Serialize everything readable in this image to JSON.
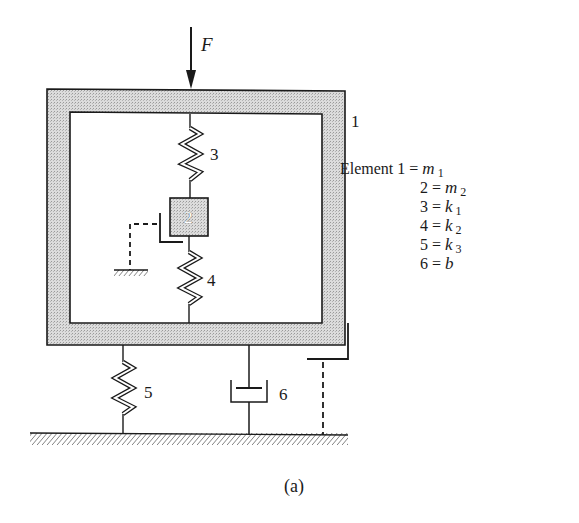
{
  "diagram": {
    "type": "mechanical-schematic",
    "caption": "(a)",
    "force_label": "F",
    "frame_label": "1",
    "mass_label": "2",
    "spring_labels": [
      "3",
      "4",
      "5"
    ],
    "damper_label": "6",
    "legend": {
      "prefix": "Element",
      "rows": [
        {
          "key": "1",
          "equals": "=",
          "var": "m",
          "sub": "1"
        },
        {
          "key": "2",
          "equals": "=",
          "var": "m",
          "sub": "2"
        },
        {
          "key": "3",
          "equals": "=",
          "var": "k",
          "sub": "1"
        },
        {
          "key": "4",
          "equals": "=",
          "var": "k",
          "sub": "2"
        },
        {
          "key": "5",
          "equals": "=",
          "var": "k",
          "sub": "3"
        },
        {
          "key": "6",
          "equals": "=",
          "var": "b",
          "sub": ""
        }
      ]
    },
    "colors": {
      "line": "#1a1a1a",
      "fill_shaded": "#d4d4d4",
      "background": "#ffffff"
    }
  }
}
